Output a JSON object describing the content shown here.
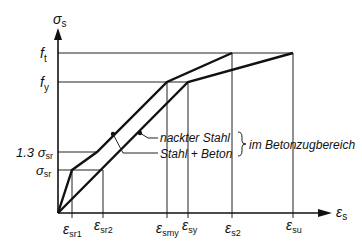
{
  "diagram": {
    "y_axis": {
      "symbol": "σ",
      "sub": "s"
    },
    "x_axis": {
      "symbol": "ε",
      "sub": "s"
    },
    "y_ticks": [
      {
        "prefix": "",
        "symbol": "f",
        "sub": "t"
      },
      {
        "prefix": "",
        "symbol": "f",
        "sub": "y"
      },
      {
        "prefix": "1.3 ",
        "symbol": "σ",
        "sub": "sr"
      },
      {
        "prefix": "",
        "symbol": "σ",
        "sub": "sr"
      }
    ],
    "x_ticks": [
      {
        "symbol": "ε",
        "sub": "sr1"
      },
      {
        "symbol": "ε",
        "sub": "sr2"
      },
      {
        "symbol": "ε",
        "sub": "smy"
      },
      {
        "symbol": "ε",
        "sub": "sy"
      },
      {
        "symbol": "ε",
        "sub": "s2"
      },
      {
        "symbol": "ε",
        "sub": "su"
      }
    ],
    "legend": {
      "line1": "nackter Stahl",
      "line2": "Stahl + Beton",
      "group_label": "im Betonzugbereich"
    },
    "curves": [
      {
        "name": "Stahl + Beton",
        "points": [
          "origin",
          "(ε_sr1, σ_sr)",
          "(ε_sr2-ish, 1.3 σ_sr)",
          "(ε_smy, f_y)",
          "(ε_s2, f_t)"
        ]
      },
      {
        "name": "nackter Stahl",
        "points": [
          "origin",
          "(ε_sy, f_y)",
          "(ε_su, f_t)"
        ]
      }
    ]
  }
}
